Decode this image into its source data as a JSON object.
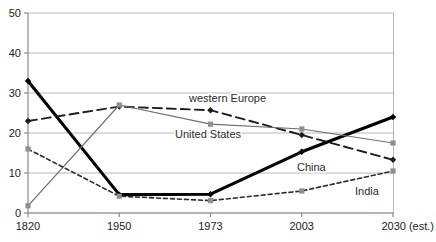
{
  "chart_data": {
    "type": "line",
    "title": "",
    "subtitle": "",
    "xlabel": "",
    "ylabel": "",
    "x": [
      "1820",
      "1950",
      "1973",
      "2003",
      "2030 (est.)"
    ],
    "categories": [
      "1820",
      "1950",
      "1973",
      "2003",
      "2030 (est.)"
    ],
    "ylim": [
      0,
      50
    ],
    "yticks": [
      0,
      10,
      20,
      30,
      40,
      50
    ],
    "ytick_labels": [
      "0",
      "10",
      "20",
      "30",
      "40",
      "50"
    ],
    "xtick_labels": [
      "1820",
      "1950",
      "1973",
      "2003",
      "2030 (est.)"
    ],
    "grid": true,
    "grid_axis": "y",
    "legend": "inline-annotations",
    "series": [
      {
        "name": "China",
        "label": "China",
        "values": [
          33.0,
          4.6,
          4.7,
          15.3,
          24.0
        ],
        "color": "#000000",
        "style": "solid",
        "width": 3.1,
        "marker": "diamond",
        "label_x": 297,
        "label_y": 171
      },
      {
        "name": "western Europe",
        "label": "western Europe",
        "values": [
          23.0,
          26.6,
          25.7,
          19.5,
          13.3
        ],
        "color": "#1c1c1c",
        "style": "dashed",
        "width": 1.9,
        "marker": "diamond",
        "label_x": 189,
        "label_y": 102
      },
      {
        "name": "United States",
        "label": "United States",
        "values": [
          1.8,
          27.0,
          22.2,
          21.0,
          17.5
        ],
        "color": "#6e6e6e",
        "style": "solid",
        "width": 1.2,
        "marker": "square",
        "label_x": 175,
        "label_y": 138
      },
      {
        "name": "India",
        "label": "India",
        "values": [
          16.0,
          4.2,
          3.1,
          5.5,
          10.5
        ],
        "color": "#2b2b2b",
        "style": "dotted",
        "width": 1.6,
        "marker": "square",
        "label_x": 355,
        "label_y": 195
      }
    ]
  },
  "axes": {
    "y_labels": [
      "50",
      "40",
      "30",
      "20",
      "10",
      "0"
    ],
    "x_labels": [
      "1820",
      "1950",
      "1973",
      "2003",
      "2030 (est.)"
    ]
  },
  "colors": {
    "china": "#000000",
    "western_europe": "#1c1c1c",
    "united_states": "#6e6e6e",
    "india": "#2b2b2b",
    "grid": "#b9b9b9",
    "axis": "#8a8a8a",
    "background": "#ffffff"
  }
}
